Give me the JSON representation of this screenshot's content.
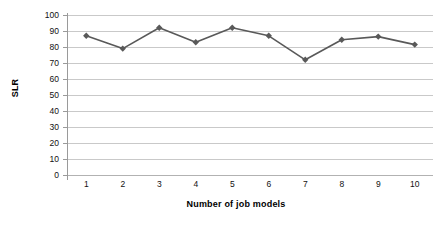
{
  "chart_data": {
    "type": "line",
    "title": "",
    "xlabel": "Number of job models",
    "ylabel": "SLR",
    "categories": [
      "1",
      "2",
      "3",
      "4",
      "5",
      "6",
      "7",
      "8",
      "9",
      "10"
    ],
    "values": [
      87,
      79,
      92,
      83,
      92,
      87,
      72,
      84.5,
      86.5,
      81.5
    ],
    "series": [
      {
        "name": "SLR",
        "values": [
          87,
          79,
          92,
          83,
          92,
          87,
          72,
          84.5,
          86.5,
          81.5
        ]
      }
    ],
    "ylim": [
      0,
      100
    ],
    "ytick_labels": [
      "100",
      "90",
      "80",
      "70",
      "60",
      "50",
      "40",
      "30",
      "20",
      "10",
      "0"
    ],
    "ytick_values": [
      100,
      90,
      80,
      70,
      60,
      50,
      40,
      30,
      20,
      10,
      0
    ],
    "ytick_step": 10,
    "grid": true,
    "grid_axis": "y",
    "legend": false,
    "legend_position": "none",
    "marker": "diamond",
    "colors": {
      "series_line": "#595959",
      "series_marker": "#595959",
      "gridline": "#c9c9c9",
      "axis_line": "#9a9a9a",
      "text": "#111111",
      "background": "#ffffff"
    }
  }
}
